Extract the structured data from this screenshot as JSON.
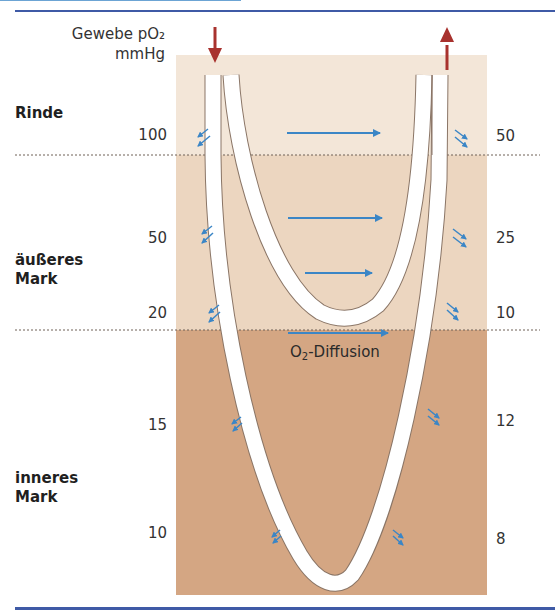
{
  "header": {
    "title_line1": "Gewebe pO₂",
    "title_line2": "mmHg"
  },
  "zones": [
    {
      "id": "rinde",
      "label": "Rinde",
      "color": "#f3e6d8"
    },
    {
      "id": "aeusseres-mark",
      "label_line1": "äußeres",
      "label_line2": "Mark",
      "color": "#ecd6c0"
    },
    {
      "id": "inneres-mark",
      "label_line1": "inneres",
      "label_line2": "Mark",
      "color": "#d4a683"
    }
  ],
  "values": {
    "left": [
      "100",
      "50",
      "20",
      "15",
      "10"
    ],
    "right": [
      "50",
      "25",
      "10",
      "12",
      "8"
    ]
  },
  "diffusion_label": {
    "prefix": "O",
    "sub": "2",
    "suffix": "-Diffusion"
  },
  "colors": {
    "rule": "#3f5aa6",
    "flow_arrow": "#a8322e",
    "diffusion_arrow": "#3b86c6",
    "vessel": "#ffffff",
    "vessel_edge": "#8a7566"
  }
}
